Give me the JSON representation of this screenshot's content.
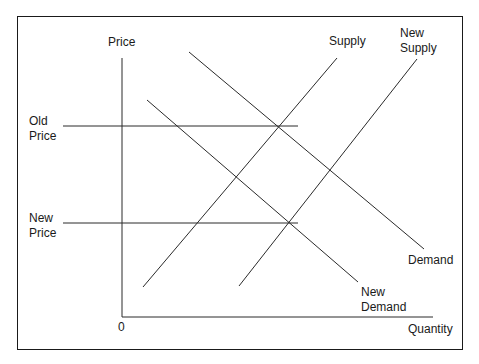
{
  "diagram": {
    "type": "supply-demand",
    "axes": {
      "y_label": "Price",
      "x_label": "Quantity",
      "origin_label": "0"
    },
    "price_levels": {
      "old_price": "Old\nPrice",
      "new_price": "New\nPrice"
    },
    "curves": {
      "supply": "Supply",
      "new_supply": "New\nSupply",
      "demand": "Demand",
      "new_demand": "New\nDemand"
    },
    "line_color": "#2a2a2a"
  }
}
